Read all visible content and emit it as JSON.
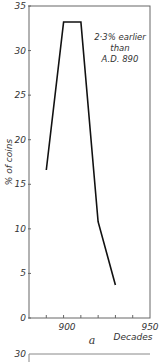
{
  "chart_data": {
    "type": "line",
    "title": "",
    "panel_label": "a",
    "xlabel": "Decades",
    "ylabel": "% of coins",
    "x": [
      890,
      900,
      910,
      920,
      930
    ],
    "values": [
      16.6,
      33.2,
      33.2,
      10.8,
      3.7
    ],
    "xlim": [
      880,
      950
    ],
    "ylim": [
      0,
      35
    ],
    "x_tick_labels": [
      "900",
      "950"
    ],
    "y_tick_labels": [
      "0",
      "5",
      "10",
      "15",
      "20",
      "25",
      "30",
      "35"
    ],
    "annotation": [
      "2·3% earlier",
      "than",
      "A.D. 890"
    ],
    "grid": false,
    "next_panel_y_tick": "30"
  }
}
